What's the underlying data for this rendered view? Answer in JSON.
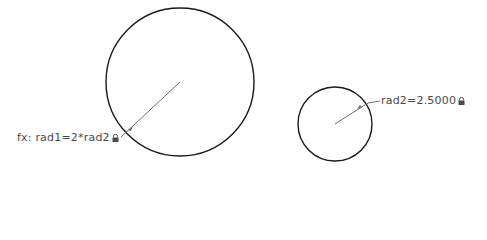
{
  "sketch": {
    "circles": [
      {
        "name": "rad1",
        "cx": 180,
        "cy": 82,
        "r": 74
      },
      {
        "name": "rad2",
        "cx": 335,
        "cy": 124,
        "r": 37
      }
    ],
    "dimensions": [
      {
        "id": "rad1",
        "text": "fx: rad1=2*rad2",
        "locked": true,
        "icon": "lock-icon"
      },
      {
        "id": "rad2",
        "text": "rad2=2.5000",
        "locked": true,
        "icon": "lock-icon"
      }
    ],
    "colors": {
      "geometry": "#1a1a1a",
      "dimension": "#6e6e6e",
      "text": "#4a4a4a"
    }
  }
}
